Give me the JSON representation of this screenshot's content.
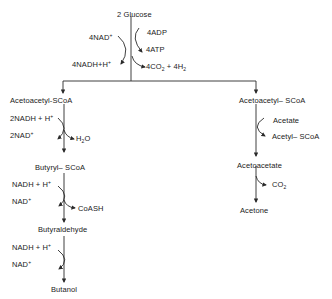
{
  "diagram": {
    "top": {
      "substrate": "2 Glucose",
      "in_left": "4NAD",
      "in_left_sup": "+",
      "out_left": "4NADH+H",
      "out_left_sup": "+",
      "in_right": "4ADP",
      "out_right_1": "4ATP",
      "out_right_2a": "4CO",
      "out_right_2_sub": "2",
      "out_right_2b": " + 4H",
      "out_right_2_sub2": "2"
    },
    "left_branch": {
      "node1": "Acetoacetyl-SCoA",
      "step1_in": "2NADH + H",
      "step1_in_sup": "+",
      "step1_out": "2NAD",
      "step1_out_sup": "+",
      "step1_side_a": "H",
      "step1_side_sub": "2",
      "step1_side_b": "O",
      "node2": "Butyryl– SCoA",
      "step2_in": "NADH + H",
      "step2_in_sup": "+",
      "step2_out": "NAD",
      "step2_out_sup": "+",
      "step2_side": "CoASH",
      "node3": "Butyraldehyde",
      "step3_in": "NADH + H",
      "step3_in_sup": "+",
      "step3_out": "NAD",
      "step3_out_sup": "+",
      "node4": "Butanol"
    },
    "right_branch": {
      "node1": "Acetoacetyl– SCoA",
      "step1_in": "Acetate",
      "step1_out": "Acetyl– SCoA",
      "node2": "Acetoacetate",
      "step2_out_a": "CO",
      "step2_out_sub": "2",
      "node3": "Acetone"
    },
    "colors": {
      "line": "#2a2a2a",
      "text": "#1a1a1a",
      "background": "#ffffff"
    }
  }
}
